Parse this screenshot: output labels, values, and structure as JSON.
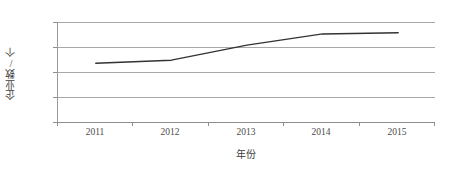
{
  "chart_data": {
    "type": "line",
    "title": "",
    "subtitle": "",
    "xlabel": "年份",
    "ylabel": "企业数/个",
    "categories": [
      "2011",
      "2012",
      "2013",
      "2014",
      "2015"
    ],
    "series": [
      {
        "name": "企业数",
        "values": [
          470,
          495,
          615,
          705,
          715
        ],
        "color": "#333333",
        "line_width": 1.5,
        "markers": "none"
      }
    ],
    "yticks": [
      0,
      200,
      400,
      600,
      800
    ],
    "ytick_labels": [
      "0",
      "200",
      "400",
      "600",
      "800"
    ],
    "ylim": [
      0,
      800
    ],
    "grid": "horizontal",
    "legend": "none",
    "plot_background": "#ffffff",
    "gridline_color": "#a8a8a8",
    "axis_color": "#8d8d8d",
    "tick_label_color": "#4a4a4a"
  }
}
